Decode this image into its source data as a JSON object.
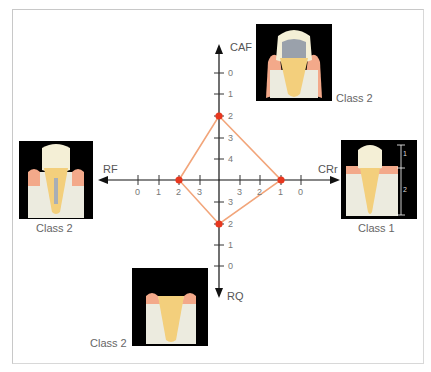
{
  "axes": {
    "up": "CAF",
    "down": "RQ",
    "left": "RF",
    "right": "CRr"
  },
  "ticks": {
    "up": [
      "0",
      "1",
      "2",
      "3",
      "4"
    ],
    "down": [
      "3",
      "2",
      "1",
      "0"
    ],
    "left": [
      "0",
      "1",
      "2",
      "3"
    ],
    "right": [
      "3",
      "2",
      "1",
      "0"
    ]
  },
  "points": {
    "up": "2",
    "down": "2",
    "left": "2",
    "right": "1"
  },
  "panels": {
    "top": {
      "label": "Class 2"
    },
    "left": {
      "label": "Class 2"
    },
    "right": {
      "label": "Class 1",
      "measure_crown": "1",
      "measure_root": "2"
    },
    "bottom": {
      "label": "Class 2"
    }
  },
  "colors": {
    "axis": "#111111",
    "diamond": "#f2a57a",
    "point": "#e8371e",
    "label": "#666666"
  }
}
